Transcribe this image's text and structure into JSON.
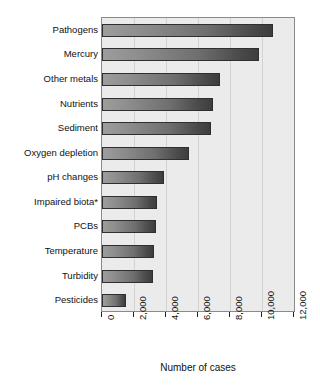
{
  "chart_data": {
    "type": "bar",
    "orientation": "horizontal",
    "title": "",
    "subtitle": "",
    "xlabel": "Number of cases",
    "ylabel": "",
    "xlim": [
      0,
      12000
    ],
    "ylim": null,
    "grid": true,
    "legend": null,
    "legend_position": "none",
    "xticks": [
      0,
      2000,
      4000,
      6000,
      8000,
      10000,
      12000
    ],
    "xtick_labels": [
      "0",
      "2,000",
      "4,000",
      "6,000",
      "8,000",
      "10,000",
      "12,000"
    ],
    "categories": [
      "Pathogens",
      "Mercury",
      "Other metals",
      "Nutrients",
      "Sediment",
      "Oxygen depletion",
      "pH changes",
      "Impaired biota*",
      "PCBs",
      "Temperature",
      "Turbidity",
      "Pesticides"
    ],
    "values": [
      10700,
      9800,
      7400,
      6950,
      6800,
      5450,
      3900,
      3450,
      3400,
      3250,
      3200,
      1500
    ],
    "annotations": [
      "*"
    ],
    "colors": {
      "bar_gradient_start": "#9d9d9d",
      "bar_gradient_end": "#3d3d3d",
      "bar_border": "#2f2f2f",
      "plot_background": "#ebebeb",
      "gridline": "#d2d2d2",
      "axis": "#8a8a8a",
      "text": "#111111",
      "page_background": "#ffffff"
    }
  },
  "axis": {
    "x_title": "Number of cases"
  }
}
